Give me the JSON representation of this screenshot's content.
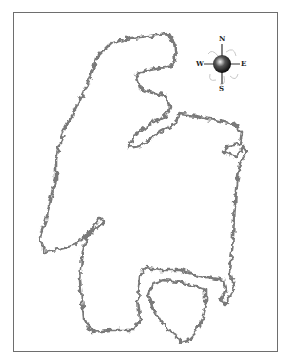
{
  "map": {
    "type": "outline-map",
    "outline_color": "#7a7a7a",
    "frame_color": "#6e6e6e",
    "background": "#ffffff",
    "regions": [
      {
        "name": "main-landmass",
        "kind": "closed-outline"
      },
      {
        "name": "inner-lake-loop",
        "kind": "closed-outline"
      }
    ]
  },
  "compass": {
    "north": "N",
    "south": "S",
    "east": "E",
    "west": "W"
  }
}
